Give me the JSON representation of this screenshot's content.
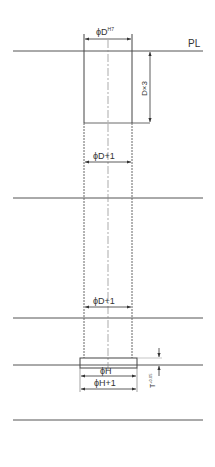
{
  "drawing": {
    "parting_line_label": "PL",
    "dim_top_diameter": {
      "prefix": "ϕD",
      "superscript": "H7"
    },
    "dim_depth": "D×3",
    "dim_upper_clearance": "ϕD+1",
    "dim_lower_clearance": "ϕD+1",
    "dim_head_diameter": "ϕH",
    "dim_head_clearance": "ϕH+1",
    "dim_head_thickness": {
      "prefix": "T",
      "superscript": "+0.05",
      "subscript": "0"
    }
  },
  "colors": {
    "line": "#444444",
    "text": "#333333",
    "background": "#ffffff"
  }
}
